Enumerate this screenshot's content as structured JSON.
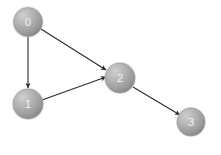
{
  "diagram": {
    "type": "directed-graph",
    "background_color": "#ffffff",
    "node_fill_light": "#b9b9b9",
    "node_fill_dark": "#8a8a8a",
    "node_edge_color": "#9a9a9a",
    "node_label_color": "#f2f2f2",
    "edge_color": "#2b2b2b",
    "edge_width": 1.1,
    "nodes": [
      {
        "id": "0",
        "label": "0",
        "cx": 28,
        "cy": 22,
        "r": 14.5
      },
      {
        "id": "1",
        "label": "1",
        "cx": 28,
        "cy": 104,
        "r": 15.0
      },
      {
        "id": "2",
        "label": "2",
        "cx": 120,
        "cy": 78,
        "r": 15.0
      },
      {
        "id": "3",
        "label": "3",
        "cx": 191,
        "cy": 122,
        "r": 14.0
      }
    ],
    "edges": [
      {
        "id": "edge-0-1",
        "source": "0",
        "target": "1",
        "directed": true,
        "x1": 28,
        "y1": 36.5,
        "x2": 28,
        "y2": 88
      },
      {
        "id": "edge-0-2",
        "source": "0",
        "target": "2",
        "directed": true,
        "x1": 41,
        "y1": 29,
        "x2": 106,
        "y2": 70
      },
      {
        "id": "edge-1-2",
        "source": "1",
        "target": "2",
        "directed": true,
        "x1": 42,
        "y1": 100,
        "x2": 106,
        "y2": 77
      },
      {
        "id": "edge-2-3",
        "source": "2",
        "target": "3",
        "directed": true,
        "x1": 133,
        "y1": 87,
        "x2": 180,
        "y2": 115
      }
    ]
  }
}
